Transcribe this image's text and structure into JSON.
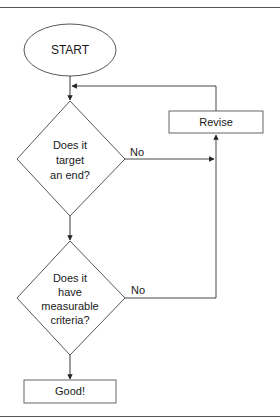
{
  "diagram": {
    "type": "flowchart",
    "nodes": {
      "start": {
        "shape": "ellipse",
        "label": "START"
      },
      "decision1": {
        "shape": "diamond",
        "label": "Does it\ntarget\nan end?"
      },
      "decision2": {
        "shape": "diamond",
        "label": "Does it\nhave\nmeasurable\ncriteria?"
      },
      "revise": {
        "shape": "rectangle",
        "label": "Revise"
      },
      "good": {
        "shape": "rectangle",
        "label": "Good!"
      }
    },
    "edges": [
      {
        "from": "start",
        "to": "decision1",
        "label": ""
      },
      {
        "from": "decision1",
        "to": "revise",
        "label": "No"
      },
      {
        "from": "decision1",
        "to": "decision2",
        "label": ""
      },
      {
        "from": "decision2",
        "to": "revise",
        "label": "No"
      },
      {
        "from": "decision2",
        "to": "good",
        "label": ""
      },
      {
        "from": "revise",
        "to": "decision1",
        "label": ""
      }
    ],
    "edge_labels": {
      "d1_no": "No",
      "d2_no": "No"
    },
    "colors": {
      "stroke": "#333333",
      "text": "#1a1a1a",
      "frame": "#555555",
      "background": "#ffffff"
    }
  }
}
